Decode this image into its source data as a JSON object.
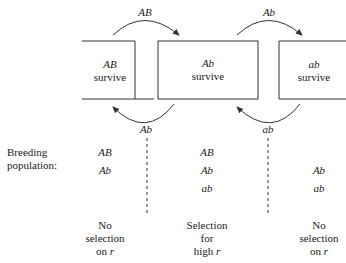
{
  "diagram": {
    "boxes": [
      {
        "genotype": "AB",
        "label": "survive"
      },
      {
        "genotype": "Ab",
        "label": "survive"
      },
      {
        "genotype": "ab",
        "label": "survive"
      }
    ],
    "arrows_top": [
      {
        "label": "AB",
        "direction": "left-to-right"
      },
      {
        "label": "Ab",
        "direction": "left-to-right"
      }
    ],
    "arrows_bottom": [
      {
        "label": "Ab",
        "direction": "right-to-left"
      },
      {
        "label": "ab",
        "direction": "right-to-left"
      }
    ],
    "breeding_label_line1": "Breeding",
    "breeding_label_line2": "population:",
    "populations": [
      [
        "AB",
        "Ab"
      ],
      [
        "AB",
        "Ab",
        "ab"
      ],
      [
        "Ab",
        "ab"
      ]
    ],
    "captions": [
      {
        "line1": "No",
        "line2": "selection",
        "line3_prefix": "on ",
        "line3_var": "r"
      },
      {
        "line1": "Selection",
        "line2": "for",
        "line3_prefix": "high ",
        "line3_var": "r"
      },
      {
        "line1": "No",
        "line2": "selection",
        "line3_prefix": "on ",
        "line3_var": "r"
      }
    ],
    "colors": {
      "line": "#333333",
      "text": "#1a1a1a"
    }
  }
}
